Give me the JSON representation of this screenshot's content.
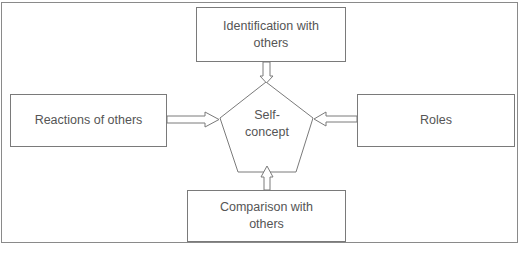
{
  "diagram": {
    "center": {
      "shape": "pentagon",
      "line1": "Self-",
      "line2": "concept"
    },
    "nodes": {
      "top": {
        "line1": "Identification with",
        "line2": "others"
      },
      "left": {
        "line1": "Reactions of others"
      },
      "right": {
        "line1": "Roles"
      },
      "bottom": {
        "line1": "Comparison with",
        "line2": "others"
      }
    },
    "edges": [
      {
        "from": "Identification with others",
        "to": "Self-concept",
        "style": "hollow-arrow"
      },
      {
        "from": "Reactions of others",
        "to": "Self-concept",
        "style": "hollow-arrow"
      },
      {
        "from": "Roles",
        "to": "Self-concept",
        "style": "hollow-arrow"
      },
      {
        "from": "Comparison with others",
        "to": "Self-concept",
        "style": "hollow-arrow"
      }
    ],
    "colors": {
      "line": "#7a7a7a",
      "text": "#555555",
      "background": "#ffffff"
    }
  }
}
